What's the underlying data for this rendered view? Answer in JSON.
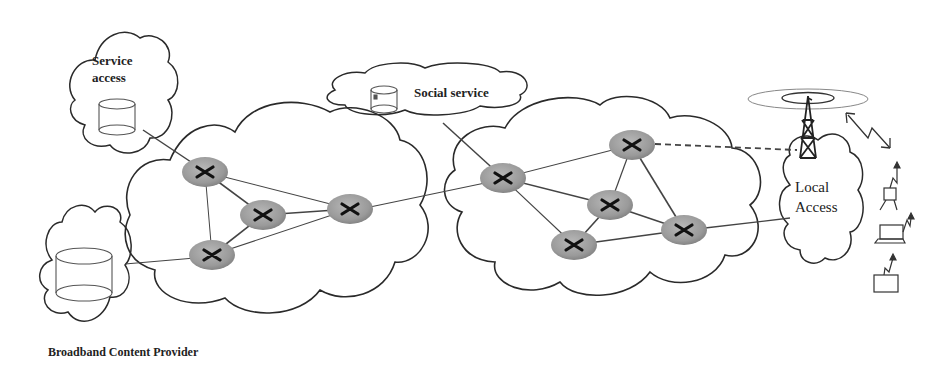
{
  "diagram": {
    "type": "network-architecture",
    "nodes": {
      "service_access": {
        "label_line1": "Service",
        "label_line2": "access",
        "kind": "cloud-with-database"
      },
      "broadband_content_provider": {
        "label": "Broadband Content Provider",
        "kind": "cloud-with-database"
      },
      "social_service": {
        "label": "Social service",
        "kind": "cloud-with-database"
      },
      "local_access": {
        "label_line1": "Local",
        "label_line2": "Access",
        "kind": "cloud-with-antenna-tower"
      },
      "core_network_left": {
        "kind": "cloud",
        "routers": 4
      },
      "core_network_right": {
        "kind": "cloud",
        "routers": 5
      },
      "mobile_devices": [
        "person-with-phone",
        "laptop",
        "terminal-device"
      ]
    },
    "edges": [
      {
        "from": "service_access",
        "to": "router-L1",
        "style": "solid"
      },
      {
        "from": "broadband_content_provider",
        "to": "router-L4",
        "style": "solid"
      },
      {
        "from": "social_service",
        "to": "router-R1",
        "style": "solid"
      },
      {
        "from": "router-L3",
        "to": "router-R1",
        "style": "solid"
      },
      {
        "from": "router-R2",
        "to": "local_access",
        "style": "dashed"
      },
      {
        "from": "router-R5",
        "to": "local_access",
        "style": "solid"
      },
      {
        "from": "antenna",
        "to": "mobile_devices",
        "style": "wireless-link"
      }
    ],
    "colors": {
      "line": "#333333",
      "router": "#9a9a9a",
      "cloud_stroke": "#2a2a2a",
      "background": "#ffffff"
    }
  }
}
